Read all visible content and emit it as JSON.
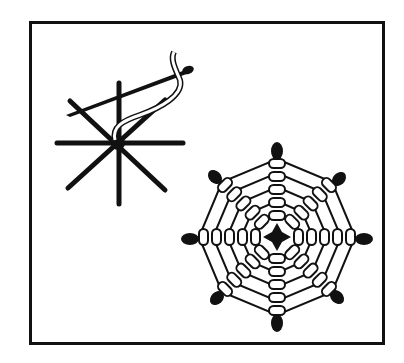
{
  "figure": {
    "panels": [
      {
        "name": "needle-working-spokes",
        "description": "Needle weaving thread under eight straight spokes"
      },
      {
        "name": "finished-spider-web",
        "description": "Completed woven spider web stitch with eight spokes"
      }
    ],
    "colors": {
      "ink": "#111111",
      "paper": "#ffffff"
    }
  }
}
